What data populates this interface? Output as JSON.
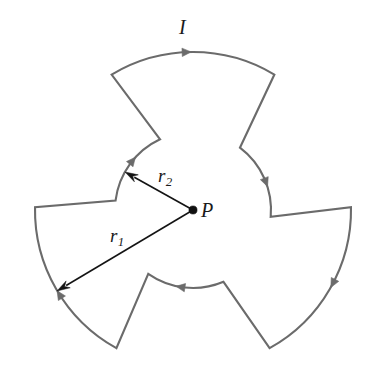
{
  "figure": {
    "background_color": "#ffffff",
    "wire_color": "#6b6b6b",
    "wire_width": 2.1,
    "dimension_color": "#141414",
    "dimension_width": 1.6,
    "center": {
      "x": 193,
      "y": 210
    },
    "radii": {
      "r1": 158,
      "r2": 78
    },
    "labels": {
      "current": "I",
      "point": "P",
      "outer_radius": "r",
      "outer_radius_sub": "1",
      "inner_radius": "r",
      "inner_radius_sub": "2"
    },
    "geometry": {
      "outer_arc_span_deg": 62,
      "inner_arc_span_deg": 58,
      "lobe_rotation_deg": 120,
      "outer_arcs": 3,
      "inner_arcs": 3,
      "current_arrows": 6
    },
    "dimension_lines": [
      {
        "name": "r1",
        "from": {
          "x": 193,
          "y": 210
        },
        "to": {
          "x": 57,
          "y": 291
        },
        "label": "r1"
      },
      {
        "name": "r2",
        "from": {
          "x": 193,
          "y": 210
        },
        "to": {
          "x": 125,
          "y": 172
        },
        "label": "r2"
      }
    ]
  }
}
